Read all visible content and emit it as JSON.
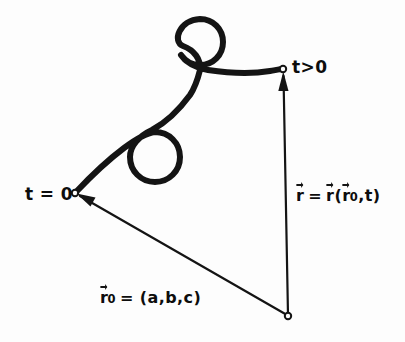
{
  "figure": {
    "background_color": "#fdfdfd",
    "ink_color": "#141414",
    "labels": {
      "start_time": "t = 0",
      "later_time": "t>0",
      "position_vector": {
        "r_sym": "r",
        "equals": "=",
        "open_paren": "(",
        "r0_sym": "r",
        "r0_sub": "0",
        "comma_t": ",t",
        "close_paren": ")"
      },
      "initial_vector": {
        "r0_sym": "r",
        "r0_sub": "0",
        "equals": "=",
        "value": "= (a,b,c)"
      }
    },
    "geometry": {
      "origin_point": {
        "x": 75,
        "y": 193,
        "name": "t = 0"
      },
      "end_point": {
        "x": 283,
        "y": 69,
        "name": "t>0"
      },
      "apex_point": {
        "x": 288,
        "y": 316,
        "name": "observer origin"
      },
      "loop_upper": {
        "cx": 200,
        "cy": 42,
        "r": 23
      },
      "loop_lower": {
        "cx": 155,
        "cy": 157,
        "r": 25
      },
      "trajectory_stroke": 6,
      "vector_stroke": 2.2
    }
  }
}
